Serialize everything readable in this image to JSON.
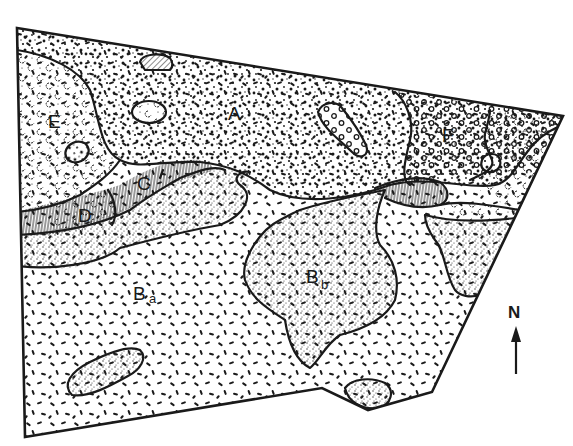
{
  "map": {
    "type": "soil / geological unit sketch map",
    "units": [
      {
        "id": "A",
        "label": "A",
        "sub": "",
        "pattern": "coarse dots"
      },
      {
        "id": "Ba",
        "label": "B",
        "sub": "a",
        "pattern": "short dashes"
      },
      {
        "id": "Bb",
        "label": "B",
        "sub": "b",
        "pattern": "fine stipple"
      },
      {
        "id": "C",
        "label": "C",
        "sub": "",
        "pattern": "vertical hatching"
      },
      {
        "id": "D",
        "label": "D",
        "sub": "",
        "pattern": "cloud / crescent marks"
      },
      {
        "id": "E",
        "label": "E",
        "sub": "",
        "pattern": "cloud / crescent marks"
      },
      {
        "id": "F",
        "label": "F",
        "sub": "",
        "pattern": "open circles"
      }
    ],
    "north_arrow": {
      "label": "N"
    },
    "colors": {
      "ink": "#1a1a1a",
      "paper": "#ffffff"
    }
  }
}
